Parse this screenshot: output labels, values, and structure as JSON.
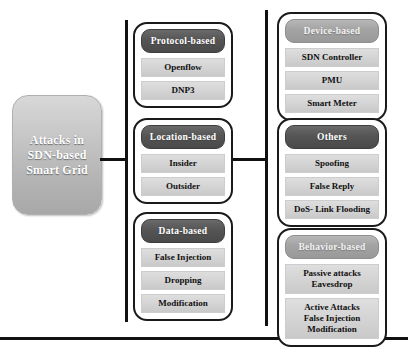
{
  "diagram": {
    "root": {
      "label": "Attacks in\nSDN-based\nSmart Grid"
    },
    "groups": [
      {
        "key": "protocol",
        "title": "Protocol-based",
        "title_style": "dark",
        "items": [
          "Openflow",
          "DNP3"
        ]
      },
      {
        "key": "location",
        "title": "Location-based",
        "title_style": "dark",
        "items": [
          "Insider",
          "Outsider"
        ]
      },
      {
        "key": "data",
        "title": "Data-based",
        "title_style": "dark",
        "items": [
          "False Injection",
          "Dropping",
          "Modification"
        ]
      },
      {
        "key": "device",
        "title": "Device-based",
        "title_style": "light",
        "items": [
          "SDN Controller",
          "PMU",
          "Smart Meter"
        ]
      },
      {
        "key": "others",
        "title": "Others",
        "title_style": "dark",
        "items": [
          "Spoofing",
          "False Reply",
          "DoS- Link Flooding"
        ]
      },
      {
        "key": "behavior",
        "title": "Behavior-based",
        "title_style": "light",
        "items": [
          "Passive attacks\nEavesdrop",
          "Active Attacks\nFalse Injection\nModification"
        ]
      }
    ],
    "colors": {
      "root_fill": "#c6c6c6",
      "title_dark": "#555555",
      "title_light": "#a3a3a3",
      "item_fill": "#d2d2d2",
      "connector": "#111111",
      "card_border": "#1a1a1a"
    }
  }
}
